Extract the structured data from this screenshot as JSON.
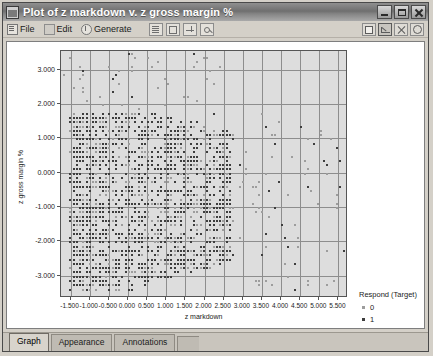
{
  "window": {
    "title": "Plot of z markdown v. z gross margin %",
    "icon": "chart-window-icon",
    "controls": {
      "minimize": "Minimize",
      "maximize": "Maximize",
      "close": "Close"
    }
  },
  "menubar": {
    "items": [
      {
        "label": "File",
        "icon": "file-menu-icon"
      },
      {
        "label": "Edit",
        "icon": "edit-menu-icon"
      },
      {
        "label": "Generate",
        "icon": "generate-menu-icon"
      }
    ],
    "tools": [
      {
        "name": "copy-button"
      },
      {
        "name": "export-button"
      },
      {
        "name": "edit-chart-button"
      },
      {
        "name": "magnify-button"
      }
    ],
    "tools_right": [
      {
        "name": "panel-toggle-button"
      },
      {
        "name": "zoom-region-button"
      },
      {
        "name": "close-view-button"
      },
      {
        "name": "help-button"
      }
    ]
  },
  "chart_data": {
    "type": "scatter",
    "title": "Plot of z markdown v. z gross margin %",
    "xlabel": "z markdown",
    "ylabel": "z gross margin %",
    "xlim": [
      -1.75,
      5.75
    ],
    "ylim": [
      -3.65,
      3.55
    ],
    "grid": true,
    "xticks": [
      "-1.500",
      "-1.000",
      "-0.500",
      "0.000",
      "0.500",
      "1.000",
      "1.500",
      "2.000",
      "2.500",
      "3.000",
      "3.500",
      "4.000",
      "4.500",
      "5.000",
      "5.500"
    ],
    "xtick_values": [
      -1.5,
      -1.0,
      -0.5,
      0.0,
      0.5,
      1.0,
      1.5,
      2.0,
      2.5,
      3.0,
      3.5,
      4.0,
      4.5,
      5.0,
      5.5
    ],
    "yticks": [
      "3.000",
      "2.000",
      "1.000",
      "0.000",
      "-1.000",
      "-2.000",
      "-3.000"
    ],
    "ytick_values": [
      3.0,
      2.0,
      1.0,
      0.0,
      -1.0,
      -2.0,
      -3.0
    ],
    "legend": {
      "title": "Respond (Target)",
      "position": "right",
      "entries": [
        {
          "label": "0",
          "color": "#9d9d9d"
        },
        {
          "label": "1",
          "color": "#3d3d3d"
        }
      ]
    },
    "series": [
      {
        "name": "0",
        "color": "#9d9d9d",
        "point_count": 620,
        "description": "Light gray points, sparser, spread across the cluster and outliers toward high z markdown"
      },
      {
        "name": "1",
        "color": "#3d3d3d",
        "point_count": 1180,
        "description": "Dark points forming a dense quantized lattice concentrated between z markdown -1.5 and 2.7, z gross margin % -3.4 to 1.8"
      }
    ],
    "cluster_summary": {
      "x_dense_range": [
        -1.5,
        2.7
      ],
      "y_dense_range": [
        -3.4,
        1.8
      ],
      "outlier_x_range": [
        2.8,
        5.6
      ],
      "note": "Negative correlation: upper-left dense wedge thins as z markdown increases"
    }
  },
  "tabs": {
    "items": [
      {
        "label": "Graph",
        "active": true
      },
      {
        "label": "Appearance",
        "active": false
      },
      {
        "label": "Annotations",
        "active": false
      }
    ]
  }
}
